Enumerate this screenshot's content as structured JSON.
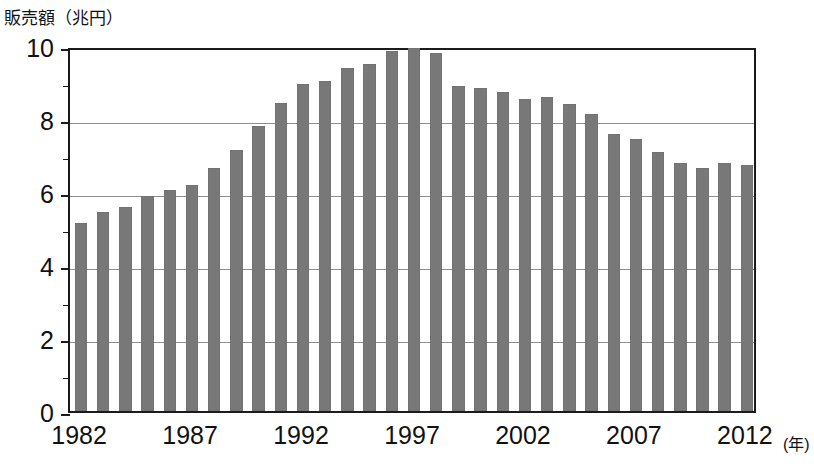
{
  "chart_data": {
    "type": "bar",
    "title": "",
    "ylabel": "販売額（兆円）",
    "xlabel": "（年）",
    "xlabel_unit": "(年)",
    "ylim": [
      0,
      10
    ],
    "y_ticks": [
      "0",
      "2",
      "4",
      "6",
      "8",
      "10"
    ],
    "y_tick_values": [
      0,
      2,
      4,
      6,
      8,
      10
    ],
    "y_minor_tick_values": [
      1,
      3,
      5,
      7,
      9
    ],
    "grid": "horizontal",
    "legend": "none",
    "bar_color": "#787878",
    "x_tick_labels": [
      "1982",
      "1987",
      "1992",
      "1997",
      "2002",
      "2007",
      "2012"
    ],
    "x_tick_years": [
      1982,
      1987,
      1992,
      1997,
      2002,
      2007,
      2012
    ],
    "categories": [
      "1982",
      "1983",
      "1984",
      "1985",
      "1986",
      "1987",
      "1988",
      "1989",
      "1990",
      "1991",
      "1992",
      "1993",
      "1994",
      "1995",
      "1996",
      "1997",
      "1998",
      "1999",
      "2000",
      "2001",
      "2002",
      "2003",
      "2004",
      "2005",
      "2006",
      "2007",
      "2008",
      "2009",
      "2010",
      "2011",
      "2012"
    ],
    "values": [
      5.15,
      5.45,
      5.6,
      5.9,
      6.05,
      6.2,
      6.65,
      7.15,
      7.8,
      8.45,
      8.95,
      9.05,
      9.4,
      9.5,
      9.85,
      9.95,
      9.8,
      8.9,
      8.85,
      8.75,
      8.55,
      8.6,
      8.4,
      8.15,
      7.6,
      7.45,
      7.1,
      6.8,
      6.65,
      6.8,
      6.75
    ]
  },
  "axis": {
    "y_caption": "販売額（兆円）",
    "x_unit_caption": "(年)"
  }
}
